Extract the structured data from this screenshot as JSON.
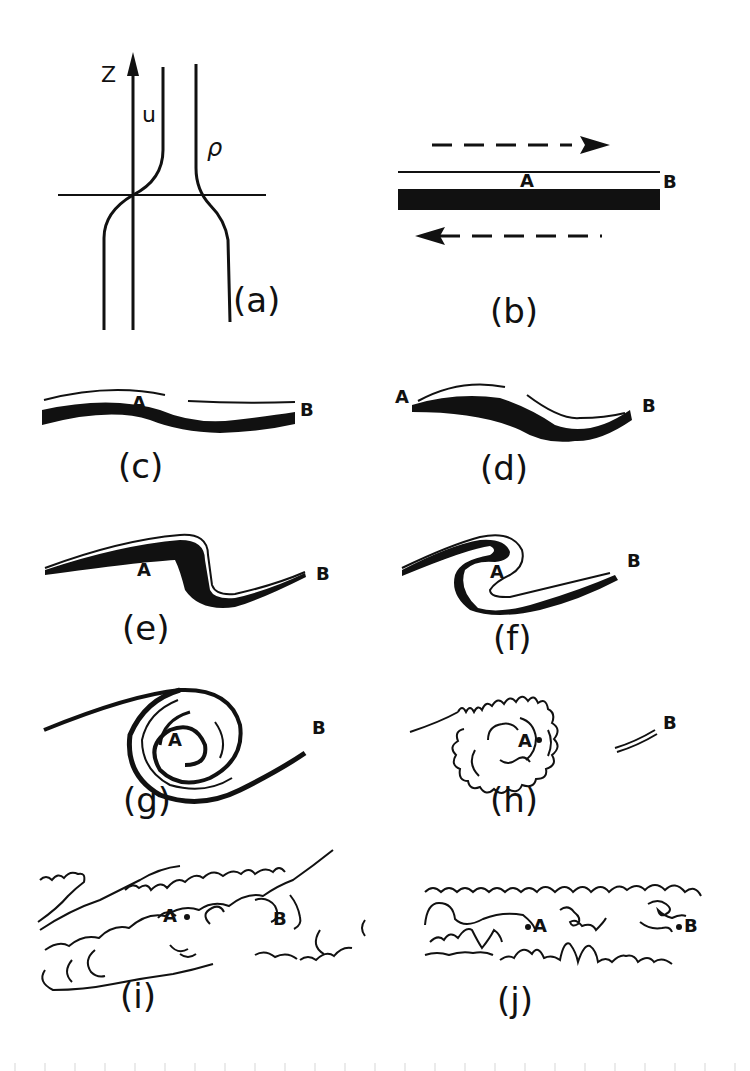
{
  "figure": {
    "panels": [
      {
        "id": "a",
        "label": "(a)",
        "axis_label": "Z",
        "curve_labels": [
          "u",
          "ρ"
        ]
      },
      {
        "id": "b",
        "label": "(b)",
        "points": [
          "A",
          "B"
        ]
      },
      {
        "id": "c",
        "label": "(c)",
        "points": [
          "A",
          "B"
        ]
      },
      {
        "id": "d",
        "label": "(d)",
        "points": [
          "A",
          "B"
        ]
      },
      {
        "id": "e",
        "label": "(e)",
        "points": [
          "A",
          "B"
        ]
      },
      {
        "id": "f",
        "label": "(f)",
        "points": [
          "A",
          "B"
        ]
      },
      {
        "id": "g",
        "label": "(g)",
        "points": [
          "A",
          "B"
        ]
      },
      {
        "id": "h",
        "label": "(h)",
        "points": [
          "A",
          "B"
        ]
      },
      {
        "id": "i",
        "label": "(i)",
        "points": [
          "A",
          "B"
        ]
      },
      {
        "id": "j",
        "label": "(j)",
        "points": [
          "A",
          "B"
        ]
      }
    ]
  },
  "colors": {
    "ink": "#111111",
    "paper": "#ffffff"
  }
}
